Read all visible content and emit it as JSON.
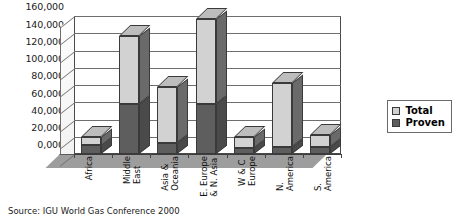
{
  "chart_data": {
    "type": "bar",
    "subtype": "stacked-3d-column",
    "title": "",
    "xlabel": "",
    "ylabel": "",
    "categories": [
      "Africa",
      "Middle\nEast",
      "Asia &\nOceania",
      "E. Europe\n& N. Asia",
      "W & C\nEurope",
      "N.\nAmerica",
      "S.\nAmerica"
    ],
    "series": [
      {
        "name": "Proven",
        "values": [
          10000,
          58000,
          13000,
          58000,
          7000,
          8000,
          8000
        ]
      },
      {
        "name": "Total",
        "values": [
          20000,
          137000,
          78000,
          157000,
          20000,
          82000,
          22000
        ]
      }
    ],
    "stacking": "total-includes-proven",
    "ylim": [
      0,
      160000
    ],
    "ytick_step": 20000,
    "ytick_labels": [
      "0,000",
      "20,000",
      "40,000",
      "60,000",
      "80,000",
      "100,000",
      "120,000",
      "140,000",
      "160,000"
    ],
    "ytick_values": [
      0,
      20000,
      40000,
      60000,
      80000,
      100000,
      120000,
      140000,
      160000
    ],
    "grid": true,
    "legend_position": "right"
  },
  "legend": {
    "items": [
      {
        "label": "Total",
        "color": "#d2d2d2"
      },
      {
        "label": "Proven",
        "color": "#5e5e5e"
      }
    ]
  },
  "source": {
    "text": "Source: IGU World Gas Conference 2000"
  }
}
